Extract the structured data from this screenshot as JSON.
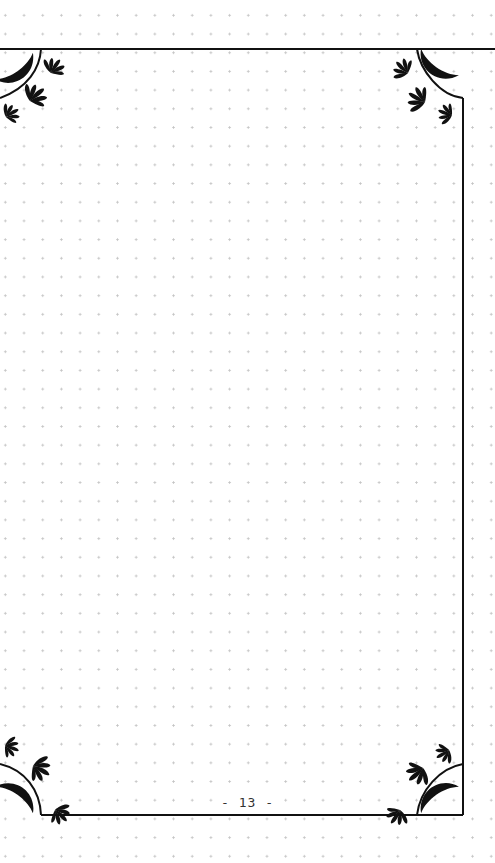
{
  "page": {
    "type": "dot-grid notebook page",
    "background_color": "#ffffff",
    "dot_color": "#c4c4c4",
    "frame_color": "#111111",
    "page_number_label": "- 13 -"
  },
  "frame": {
    "style": "ornamental border with inverted corner arcs",
    "corner_ornaments": [
      "crescent-moon",
      "fan-leaf-sprigs"
    ]
  }
}
